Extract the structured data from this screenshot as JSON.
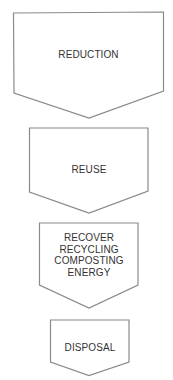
{
  "diagram": {
    "colors": {
      "stroke": "#8a8a8a",
      "fill": "#ffffff",
      "text": "#333333"
    },
    "steps": [
      {
        "label_lines": [
          "REDUCTION"
        ]
      },
      {
        "label_lines": [
          "REUSE"
        ]
      },
      {
        "label_lines": [
          "RECOVER",
          "RECYCLING",
          "COMPOSTING",
          "ENERGY"
        ]
      },
      {
        "label_lines": [
          "DISPOSAL"
        ]
      }
    ]
  }
}
